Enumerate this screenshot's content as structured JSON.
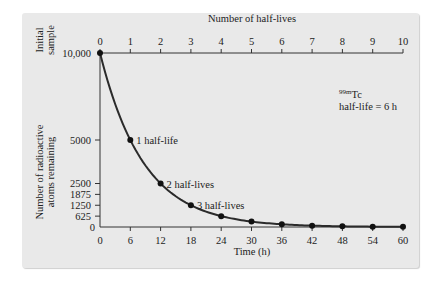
{
  "chart_data": {
    "type": "line",
    "title": "",
    "xlabel": "Time (h)",
    "ylabel": "Number of radioactive atoms remaining",
    "top_axis_label": "Number of half-lives",
    "top_axis_ticks": [
      "0",
      "1",
      "2",
      "3",
      "4",
      "5",
      "6",
      "7",
      "8",
      "9",
      "10"
    ],
    "x_ticks": [
      "0",
      "6",
      "12",
      "18",
      "24",
      "30",
      "36",
      "42",
      "48",
      "54",
      "60"
    ],
    "y_ticks": [
      "0",
      "625",
      "1250",
      "1875",
      "2500",
      "5000",
      "10,000"
    ],
    "y_tick_values": [
      0,
      625,
      1250,
      1875,
      2500,
      5000,
      10000
    ],
    "initial_sample_label": "Initial sample",
    "xlim": [
      0,
      60
    ],
    "ylim": [
      0,
      10000
    ],
    "grid": false,
    "series": [
      {
        "name": "99mTc decay",
        "x": [
          0,
          6,
          12,
          18,
          24,
          30,
          36,
          42,
          48,
          54,
          60
        ],
        "values": [
          10000,
          5000,
          2500,
          1250,
          625,
          312.5,
          156.25,
          78.125,
          39.06,
          19.53,
          9.77
        ]
      }
    ],
    "annotations": [
      {
        "text": "1 half-life",
        "x": 6,
        "y": 5000
      },
      {
        "text": "2 half-lives",
        "x": 12,
        "y": 2500
      },
      {
        "text": "3 half-lives",
        "x": 18,
        "y": 1250
      }
    ],
    "isotope_label": {
      "superscript": "99m",
      "symbol": "Tc",
      "half_life": "half-life = 6 h"
    }
  },
  "labels": {
    "initial_line1": "Initial",
    "initial_line2": "sample",
    "ylabel_line1": "Number of radioactive",
    "ylabel_line2": "atoms remaining",
    "iso_sup": "99m",
    "iso_sym": "Tc",
    "half_life": "half-life = 6 h"
  }
}
